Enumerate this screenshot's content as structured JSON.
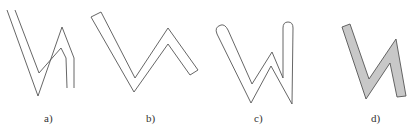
{
  "figure": {
    "panels": [
      {
        "id": "a",
        "label": "a)",
        "style": "double-line open stroke"
      },
      {
        "id": "b",
        "label": "b)",
        "style": "closed outline band with square ends"
      },
      {
        "id": "c",
        "label": "c)",
        "style": "closed outline band with rounded ends"
      },
      {
        "id": "d",
        "label": "d)",
        "style": "filled gray polygon band"
      }
    ],
    "colors": {
      "stroke": "#555555",
      "fill_d": "#c8c8c8",
      "background": "#ffffff"
    }
  }
}
